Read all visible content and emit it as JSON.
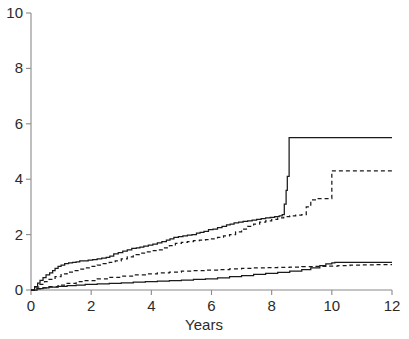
{
  "chart_data": {
    "type": "line",
    "title": "",
    "subtitle": "",
    "xlabel": "Years",
    "ylabel": "",
    "xlim": [
      0,
      12
    ],
    "ylim": [
      0,
      10
    ],
    "xticks": [
      0,
      2,
      4,
      6,
      8,
      10,
      12
    ],
    "xtick_labels": [
      "0",
      "2",
      "4",
      "6",
      "8",
      "10",
      "12"
    ],
    "yticks": [
      0,
      2,
      4,
      6,
      8,
      10
    ],
    "ytick_labels": [
      "0",
      "2",
      "4",
      "6",
      "8",
      "10"
    ],
    "grid": false,
    "legend": "none",
    "step_style": "post",
    "annotations": [],
    "series": [
      {
        "name": "upper-solid",
        "style": "solid",
        "color": "#1a1a1a",
        "final_value": 5.5,
        "x": [
          0,
          0.12,
          0.22,
          0.3,
          0.4,
          0.5,
          0.62,
          0.72,
          0.8,
          0.9,
          1.0,
          1.12,
          1.25,
          1.38,
          1.5,
          1.62,
          1.75,
          1.9,
          2.05,
          2.2,
          2.35,
          2.5,
          2.62,
          2.75,
          2.9,
          3.05,
          3.2,
          3.35,
          3.5,
          3.62,
          3.75,
          3.9,
          4.05,
          4.2,
          4.35,
          4.5,
          4.62,
          4.75,
          4.9,
          5.05,
          5.2,
          5.35,
          5.5,
          5.62,
          5.75,
          5.9,
          6.05,
          6.2,
          6.35,
          6.5,
          6.62,
          6.75,
          6.9,
          7.05,
          7.2,
          7.35,
          7.5,
          7.65,
          7.8,
          7.95,
          8.1,
          8.25,
          8.35,
          8.42,
          8.48,
          8.52,
          8.58,
          12
        ],
        "y": [
          0,
          0.12,
          0.25,
          0.35,
          0.45,
          0.55,
          0.62,
          0.7,
          0.78,
          0.85,
          0.9,
          0.95,
          0.98,
          1.0,
          1.02,
          1.05,
          1.05,
          1.08,
          1.1,
          1.12,
          1.15,
          1.18,
          1.22,
          1.3,
          1.35,
          1.4,
          1.45,
          1.5,
          1.52,
          1.55,
          1.58,
          1.62,
          1.66,
          1.7,
          1.75,
          1.8,
          1.85,
          1.9,
          1.93,
          1.95,
          1.98,
          2.0,
          2.05,
          2.08,
          2.12,
          2.18,
          2.2,
          2.25,
          2.3,
          2.35,
          2.38,
          2.42,
          2.45,
          2.48,
          2.5,
          2.52,
          2.55,
          2.58,
          2.6,
          2.62,
          2.65,
          2.68,
          2.72,
          3.1,
          3.6,
          4.1,
          5.5,
          5.5
        ]
      },
      {
        "name": "upper-dashed",
        "style": "dashed",
        "color": "#1a1a1a",
        "final_value": 4.3,
        "x": [
          0,
          0.15,
          0.3,
          0.45,
          0.6,
          0.8,
          1.0,
          1.2,
          1.4,
          1.6,
          1.8,
          2.0,
          2.2,
          2.4,
          2.6,
          2.8,
          3.0,
          3.2,
          3.4,
          3.6,
          3.8,
          4.0,
          4.2,
          4.4,
          4.6,
          4.8,
          5.0,
          5.2,
          5.4,
          5.6,
          5.8,
          6.0,
          6.2,
          6.4,
          6.6,
          6.8,
          7.0,
          7.2,
          7.4,
          7.6,
          7.8,
          8.0,
          8.2,
          8.4,
          8.6,
          8.8,
          9.0,
          9.15,
          9.3,
          9.5,
          9.7,
          9.85,
          10.0,
          12
        ],
        "y": [
          0,
          0.1,
          0.2,
          0.3,
          0.38,
          0.48,
          0.58,
          0.65,
          0.7,
          0.75,
          0.8,
          0.85,
          0.9,
          0.95,
          1.0,
          1.05,
          1.12,
          1.2,
          1.28,
          1.33,
          1.38,
          1.42,
          1.45,
          1.52,
          1.6,
          1.68,
          1.72,
          1.75,
          1.78,
          1.8,
          1.82,
          1.85,
          1.9,
          1.95,
          2.0,
          2.1,
          2.2,
          2.3,
          2.38,
          2.45,
          2.5,
          2.55,
          2.6,
          2.65,
          2.68,
          2.7,
          2.72,
          3.0,
          3.25,
          3.3,
          3.3,
          3.3,
          4.3,
          4.3
        ]
      },
      {
        "name": "lower-solid",
        "style": "solid",
        "color": "#1a1a1a",
        "final_value": 1.0,
        "x": [
          0,
          0.2,
          0.4,
          0.6,
          0.9,
          1.2,
          1.5,
          1.8,
          2.2,
          2.6,
          3.0,
          3.4,
          3.8,
          4.2,
          4.6,
          5.0,
          5.4,
          5.8,
          6.2,
          6.6,
          7.0,
          7.4,
          7.8,
          8.2,
          8.6,
          9.0,
          9.3,
          9.6,
          9.8,
          10.0,
          10.1,
          10.2,
          12
        ],
        "y": [
          0,
          0.05,
          0.08,
          0.1,
          0.13,
          0.16,
          0.18,
          0.2,
          0.22,
          0.24,
          0.26,
          0.28,
          0.3,
          0.32,
          0.34,
          0.36,
          0.38,
          0.4,
          0.44,
          0.48,
          0.52,
          0.56,
          0.6,
          0.64,
          0.68,
          0.74,
          0.8,
          0.88,
          0.94,
          0.98,
          1.0,
          1.0,
          1.0
        ]
      },
      {
        "name": "lower-dashed",
        "style": "dashed",
        "color": "#1a1a1a",
        "final_value": 0.92,
        "x": [
          0,
          0.2,
          0.4,
          0.6,
          0.9,
          1.2,
          1.5,
          1.8,
          2.2,
          2.6,
          3.0,
          3.4,
          3.8,
          4.2,
          4.6,
          5.0,
          5.4,
          5.8,
          6.2,
          6.6,
          7.0,
          7.4,
          7.8,
          8.2,
          8.6,
          9.0,
          9.4,
          9.8,
          10.2,
          10.6,
          11.0,
          11.4,
          12
        ],
        "y": [
          0,
          0.04,
          0.08,
          0.12,
          0.18,
          0.24,
          0.3,
          0.34,
          0.4,
          0.46,
          0.5,
          0.55,
          0.58,
          0.62,
          0.65,
          0.68,
          0.7,
          0.72,
          0.74,
          0.76,
          0.78,
          0.8,
          0.81,
          0.82,
          0.83,
          0.84,
          0.85,
          0.86,
          0.88,
          0.9,
          0.91,
          0.92,
          0.92
        ]
      }
    ]
  },
  "figure": {
    "xlabel": "Years",
    "background_color": "#ffffff",
    "line_color": "#1a1a1a",
    "axis_color": "#8a8a8a"
  }
}
